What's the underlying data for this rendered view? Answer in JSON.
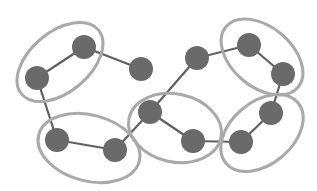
{
  "diagram": {
    "title": "",
    "colors": {
      "background": "#ffffff",
      "node_fill": "#6a6a6a",
      "edge": "#5f5f5f",
      "cluster_ring": "#a9a9a9"
    },
    "node_radius": 12,
    "nodes": [
      {
        "id": "A",
        "x": 84,
        "y": 47
      },
      {
        "id": "B",
        "x": 37,
        "y": 78
      },
      {
        "id": "C",
        "x": 141,
        "y": 69
      },
      {
        "id": "D",
        "x": 57,
        "y": 140
      },
      {
        "id": "E",
        "x": 115,
        "y": 150
      },
      {
        "id": "F",
        "x": 150,
        "y": 112
      },
      {
        "id": "G",
        "x": 193,
        "y": 141
      },
      {
        "id": "H",
        "x": 197,
        "y": 58
      },
      {
        "id": "I",
        "x": 249,
        "y": 45
      },
      {
        "id": "J",
        "x": 283,
        "y": 74
      },
      {
        "id": "K",
        "x": 271,
        "y": 113
      },
      {
        "id": "L",
        "x": 241,
        "y": 142
      }
    ],
    "edges": [
      [
        "A",
        "B"
      ],
      [
        "A",
        "C"
      ],
      [
        "B",
        "D"
      ],
      [
        "D",
        "E"
      ],
      [
        "E",
        "F"
      ],
      [
        "F",
        "H"
      ],
      [
        "F",
        "G"
      ],
      [
        "G",
        "L"
      ],
      [
        "L",
        "K"
      ],
      [
        "K",
        "J"
      ],
      [
        "J",
        "I"
      ],
      [
        "I",
        "H"
      ]
    ],
    "clusters": [
      {
        "id": "cluster-1",
        "members": [
          "A",
          "B"
        ],
        "cx": 60,
        "cy": 62,
        "rx": 50,
        "ry": 30,
        "rotate": -40
      },
      {
        "id": "cluster-2",
        "members": [
          "D",
          "E"
        ],
        "cx": 89,
        "cy": 148,
        "rx": 52,
        "ry": 33,
        "rotate": 15
      },
      {
        "id": "cluster-3",
        "members": [
          "F",
          "G"
        ],
        "cx": 175,
        "cy": 128,
        "rx": 47,
        "ry": 34,
        "rotate": 12
      },
      {
        "id": "cluster-4",
        "members": [
          "I",
          "J"
        ],
        "cx": 262,
        "cy": 57,
        "rx": 47,
        "ry": 30,
        "rotate": 40
      },
      {
        "id": "cluster-5",
        "members": [
          "K",
          "L"
        ],
        "cx": 262,
        "cy": 133,
        "rx": 47,
        "ry": 31,
        "rotate": -40
      }
    ]
  }
}
